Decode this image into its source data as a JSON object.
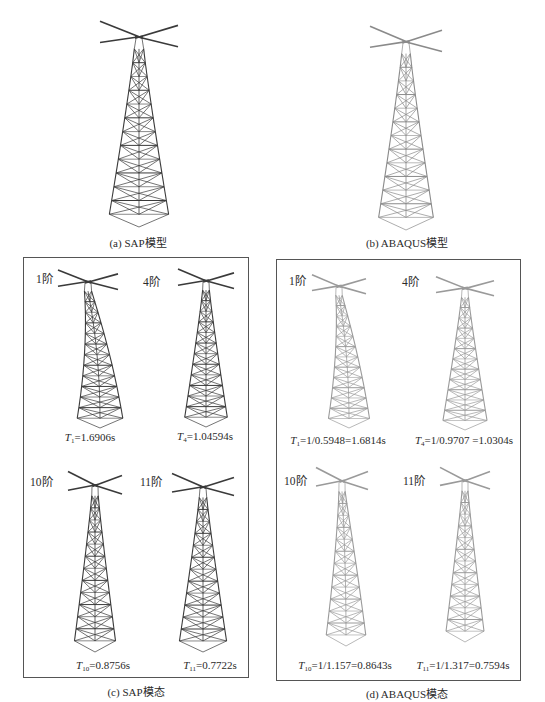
{
  "figure": {
    "panels": {
      "a": {
        "caption": "(a) SAP模型",
        "tower_color": "#3a3a3a"
      },
      "b": {
        "caption": "(b) ABAQUS模型",
        "tower_color": "#8a8a8a"
      },
      "c": {
        "caption": "(c) SAP模态",
        "tower_color": "#3a3a3a",
        "modes": [
          {
            "order_label": "1阶",
            "period_symbol": "T",
            "period_sub": "1",
            "period_value": "=1.6906s"
          },
          {
            "order_label": "4阶",
            "period_symbol": "T",
            "period_sub": "4",
            "period_value": "=1.04594s"
          },
          {
            "order_label": "10阶",
            "period_symbol": "T",
            "period_sub": "10",
            "period_value": "=0.8756s"
          },
          {
            "order_label": "11阶",
            "period_symbol": "T",
            "period_sub": "11",
            "period_value": "=0.7722s"
          }
        ]
      },
      "d": {
        "caption": "(d) ABAQUS模态",
        "tower_color": "#9a9a9a",
        "modes": [
          {
            "order_label": "1阶",
            "period_symbol": "T",
            "period_sub": "1",
            "period_value": "=1/0.5948=1.6814s"
          },
          {
            "order_label": "4阶",
            "period_symbol": "T",
            "period_sub": "4",
            "period_value": "=1/0.9707 =1.0304s"
          },
          {
            "order_label": "10阶",
            "period_symbol": "T",
            "period_sub": "10",
            "period_value": "=1/1.157=0.8643s"
          },
          {
            "order_label": "11阶",
            "period_symbol": "T",
            "period_sub": "11",
            "period_value": "=1/1.317=0.7594s"
          }
        ]
      }
    }
  }
}
